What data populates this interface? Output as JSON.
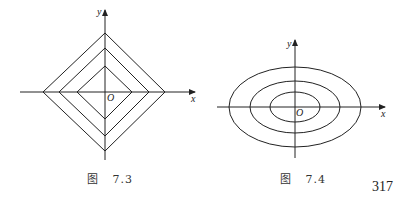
{
  "figures": [
    {
      "id": "fig-7-3",
      "caption_prefix": "图",
      "caption_number": "7.3",
      "axis_labels": {
        "x": "x",
        "y": "y",
        "origin": "O"
      },
      "shape": "diamond contours (|x|+|y|=c)",
      "contour_count": 3
    },
    {
      "id": "fig-7-4",
      "caption_prefix": "图",
      "caption_number": "7.4",
      "axis_labels": {
        "x": "x",
        "y": "y",
        "origin": "O"
      },
      "shape": "elliptical contours",
      "contour_count": 3
    }
  ],
  "page_number": "317",
  "colors": {
    "line": "#222222",
    "text": "#333333",
    "background": "#ffffff"
  }
}
